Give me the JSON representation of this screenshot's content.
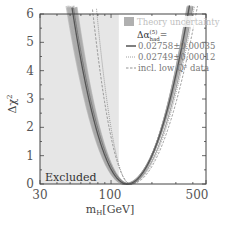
{
  "chart_data": {
    "type": "line",
    "title": "",
    "xlabel": "m_H[GeV]",
    "ylabel": "Δχ²",
    "xscale": "log",
    "xlim": [
      30,
      500
    ],
    "ylim": [
      0,
      6
    ],
    "x_ticks": [
      30,
      100,
      500
    ],
    "y_ticks": [
      0,
      1,
      2,
      3,
      4,
      5,
      6
    ],
    "grid": false,
    "excluded_region": {
      "label": "Excluded",
      "x_range": [
        30,
        114
      ]
    },
    "legend": {
      "position": "upper right",
      "band_label": "Theory uncertainty",
      "title": "Δα_had^(5) =",
      "entries": [
        {
          "label": "0.02758±0.00035",
          "style": "solid"
        },
        {
          "label": "0.02749±0.00012",
          "style": "dotted"
        },
        {
          "label": "incl. low Q² data",
          "style": "dashed"
        }
      ]
    },
    "series": [
      {
        "name": "0.02758±0.00035",
        "style": "solid",
        "min_x": 87,
        "min_y": 0,
        "band": true,
        "points": [
          [
            45,
            6
          ],
          [
            60,
            3.2
          ],
          [
            87,
            0
          ],
          [
            130,
            1.2
          ],
          [
            170,
            3.5
          ],
          [
            210,
            6
          ]
        ]
      },
      {
        "name": "0.02749±0.00012",
        "style": "dotted",
        "min_x": 84,
        "min_y": 0,
        "points": [
          [
            44,
            6
          ],
          [
            84,
            0
          ],
          [
            205,
            6
          ]
        ]
      },
      {
        "name": "incl. low Q² data",
        "style": "dashed",
        "min_x": 95,
        "min_y": 0,
        "points": [
          [
            58,
            6
          ],
          [
            95,
            0
          ],
          [
            230,
            6
          ]
        ]
      }
    ]
  },
  "labels": {
    "x_axis_title_main": "m",
    "x_axis_title_sub": "H",
    "x_axis_title_unit": "[GeV]",
    "y_axis_title_main": "Δχ",
    "y_axis_title_sup": "2",
    "excluded": "Excluded",
    "band_label": "Theory uncertainty",
    "legend_title_main": "Δα",
    "legend_title_sup": "(5)",
    "legend_title_sub": "had",
    "legend_title_eq": "=",
    "entry1": "0.02758±0.00035",
    "entry2": "0.02749±0.00012",
    "entry3": "incl. low Q² data",
    "x_tick_30": "30",
    "x_tick_100": "100",
    "x_tick_500": "500",
    "y_tick_0": "0",
    "y_tick_1": "1",
    "y_tick_2": "2",
    "y_tick_3": "3",
    "y_tick_4": "4",
    "y_tick_5": "5",
    "y_tick_6": "6"
  },
  "colors": {
    "excluded_fill": "#e6e6e6",
    "band_fill": "#a8a8a8",
    "solid_line": "#555555",
    "dotted_line": "#888888",
    "dashed_line": "#777777",
    "frame": "#444444"
  }
}
